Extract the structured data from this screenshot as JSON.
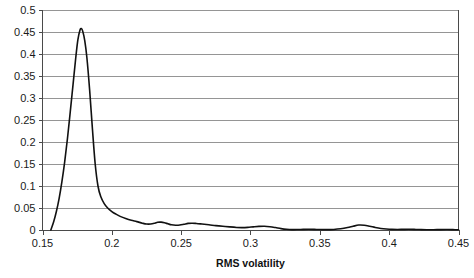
{
  "chart_data": {
    "type": "line",
    "title": "",
    "xlabel": "RMS volatility",
    "ylabel": "",
    "xlim": [
      0.15,
      0.45
    ],
    "ylim": [
      0,
      0.5
    ],
    "grid": "horizontal",
    "legend": "none",
    "xticks": [
      "0.15",
      "0.2",
      "0.25",
      "0.3",
      "0.35",
      "0.4",
      "0.45"
    ],
    "xtick_values": [
      0.15,
      0.2,
      0.25,
      0.3,
      0.35,
      0.4,
      0.45
    ],
    "yticks": [
      "0",
      "0.05",
      "0.1",
      "0.15",
      "0.2",
      "0.25",
      "0.3",
      "0.35",
      "0.4",
      "0.45",
      "0.5"
    ],
    "ytick_values": [
      0,
      0.05,
      0.1,
      0.15,
      0.2,
      0.25,
      0.3,
      0.35,
      0.4,
      0.45,
      0.5
    ],
    "series": [
      {
        "name": "RMS volatility density",
        "color": "#111111",
        "x": [
          0.156,
          0.158,
          0.16,
          0.162,
          0.164,
          0.166,
          0.168,
          0.17,
          0.172,
          0.174,
          0.1755,
          0.177,
          0.178,
          0.179,
          0.1805,
          0.182,
          0.184,
          0.186,
          0.188,
          0.19,
          0.192,
          0.1945,
          0.197,
          0.2,
          0.203,
          0.206,
          0.21,
          0.214,
          0.218,
          0.222,
          0.225,
          0.228,
          0.231,
          0.233,
          0.2355,
          0.238,
          0.2405,
          0.243,
          0.246,
          0.249,
          0.252,
          0.255,
          0.258,
          0.261,
          0.265,
          0.27,
          0.275,
          0.28,
          0.285,
          0.29,
          0.294,
          0.298,
          0.302,
          0.306,
          0.31,
          0.314,
          0.318,
          0.322,
          0.326,
          0.33,
          0.334,
          0.338,
          0.342,
          0.346,
          0.35,
          0.355,
          0.36,
          0.365,
          0.37,
          0.374,
          0.378,
          0.382,
          0.386,
          0.39,
          0.394,
          0.398,
          0.402,
          0.406,
          0.41,
          0.414,
          0.418,
          0.422,
          0.427,
          0.432,
          0.437,
          0.442,
          0.446,
          0.45
        ],
        "y": [
          0.0,
          0.018,
          0.042,
          0.072,
          0.11,
          0.155,
          0.208,
          0.268,
          0.33,
          0.392,
          0.432,
          0.454,
          0.458,
          0.452,
          0.43,
          0.392,
          0.318,
          0.23,
          0.15,
          0.1,
          0.076,
          0.06,
          0.05,
          0.042,
          0.036,
          0.031,
          0.026,
          0.022,
          0.019,
          0.0155,
          0.0135,
          0.0135,
          0.0155,
          0.0175,
          0.0178,
          0.0165,
          0.014,
          0.0118,
          0.0108,
          0.0112,
          0.013,
          0.015,
          0.0155,
          0.0148,
          0.0135,
          0.0118,
          0.01,
          0.0085,
          0.007,
          0.0058,
          0.0055,
          0.006,
          0.0072,
          0.0082,
          0.0085,
          0.0075,
          0.0055,
          0.0032,
          0.0016,
          0.0009,
          0.001,
          0.0014,
          0.0016,
          0.0014,
          0.001,
          0.0008,
          0.0013,
          0.0028,
          0.0055,
          0.0085,
          0.0112,
          0.0108,
          0.0085,
          0.0058,
          0.0036,
          0.0022,
          0.0014,
          0.0012,
          0.0014,
          0.0016,
          0.0014,
          0.001,
          0.0006,
          0.0006,
          0.0009,
          0.001,
          0.0008,
          0.0005
        ]
      }
    ]
  },
  "axis": {
    "x_title": "RMS volatility"
  }
}
